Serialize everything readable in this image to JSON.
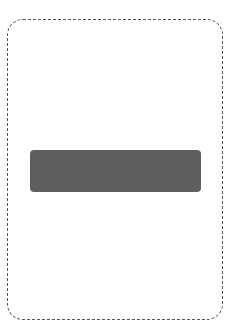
{
  "card": {
    "border_style": "dashed",
    "border_color": "#555555",
    "background": "#ffffff"
  },
  "bar": {
    "color": "#5f5f5f",
    "label": ""
  }
}
